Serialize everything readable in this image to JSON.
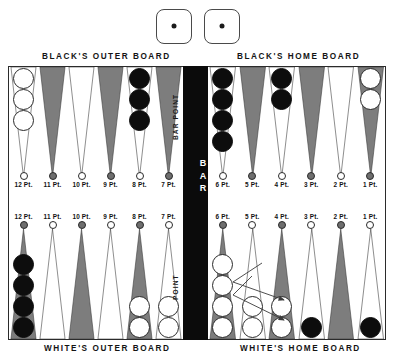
{
  "dice": {
    "name": "dice-pair",
    "values": [
      1,
      1
    ],
    "count": 2
  },
  "headings": {
    "black_outer": "BLACK'S OUTER BOARD",
    "black_home": "BLACK'S HOME BOARD",
    "white_outer": "WHITE'S OUTER BOARD",
    "white_home": "WHITE'S HOME BOARD"
  },
  "bar": {
    "label": "BAR",
    "color": "#0b0b0b"
  },
  "inline_labels": {
    "bar_point": "BAR POINT",
    "point": "POINT"
  },
  "colors": {
    "checker_black": "#0d0d0d",
    "checker_white": "#ffffff",
    "triangle_dark": "#7d7d7d",
    "triangle_light": "#ffffff",
    "board_border": "#2b2b2b",
    "bar_black": "#0b0b0b",
    "arrow": "#3b3b3b"
  },
  "point_labels": {
    "top_left": [
      "12 Pt.",
      "11 Pt.",
      "10 Pt.",
      "9 Pt.",
      "8 Pt.",
      "7 Pt."
    ],
    "top_right": [
      "6 Pt.",
      "5 Pt.",
      "4 Pt.",
      "3 Pt.",
      "2 Pt.",
      "1 Pt."
    ],
    "bottom_left": [
      "12 Pt.",
      "11 Pt.",
      "10 Pt.",
      "9 Pt.",
      "8 Pt.",
      "7 Pt."
    ],
    "bottom_right": [
      "6 Pt.",
      "5 Pt.",
      "4 Pt.",
      "3 Pt.",
      "2 Pt.",
      "1 Pt."
    ]
  },
  "board": {
    "top_left_quadrant": [
      {
        "point": "12 Pt.",
        "shade": "light",
        "checker_color": "white",
        "checkers": 3
      },
      {
        "point": "11 Pt.",
        "shade": "dark",
        "checker_color": "none",
        "checkers": 0
      },
      {
        "point": "10 Pt.",
        "shade": "light",
        "checker_color": "none",
        "checkers": 0
      },
      {
        "point": "9 Pt.",
        "shade": "dark",
        "checker_color": "none",
        "checkers": 0
      },
      {
        "point": "8 Pt.",
        "shade": "light",
        "checker_color": "black",
        "checkers": 3
      },
      {
        "point": "7 Pt.",
        "shade": "dark",
        "checker_color": "none",
        "checkers": 0
      }
    ],
    "top_right_quadrant": [
      {
        "point": "6 Pt.",
        "shade": "light",
        "checker_color": "black",
        "checkers": 4
      },
      {
        "point": "5 Pt.",
        "shade": "dark",
        "checker_color": "none",
        "checkers": 0
      },
      {
        "point": "4 Pt.",
        "shade": "light",
        "checker_color": "black",
        "checkers": 2
      },
      {
        "point": "3 Pt.",
        "shade": "dark",
        "checker_color": "none",
        "checkers": 0
      },
      {
        "point": "2 Pt.",
        "shade": "light",
        "checker_color": "none",
        "checkers": 0
      },
      {
        "point": "1 Pt.",
        "shade": "dark",
        "checker_color": "white",
        "checkers": 2
      }
    ],
    "bottom_left_quadrant": [
      {
        "point": "12 Pt.",
        "shade": "dark",
        "checker_color": "black",
        "checkers": 4
      },
      {
        "point": "11 Pt.",
        "shade": "light",
        "checker_color": "none",
        "checkers": 0
      },
      {
        "point": "10 Pt.",
        "shade": "dark",
        "checker_color": "none",
        "checkers": 0
      },
      {
        "point": "9 Pt.",
        "shade": "light",
        "checker_color": "none",
        "checkers": 0
      },
      {
        "point": "8 Pt.",
        "shade": "dark",
        "checker_color": "white",
        "checkers": 2
      },
      {
        "point": "7 Pt.",
        "shade": "light",
        "checker_color": "white",
        "checkers": 2
      }
    ],
    "bottom_right_quadrant": [
      {
        "point": "6 Pt.",
        "shade": "dark",
        "checker_color": "white",
        "checkers": 4
      },
      {
        "point": "5 Pt.",
        "shade": "light",
        "checker_color": "white",
        "checkers": 2
      },
      {
        "point": "4 Pt.",
        "shade": "dark",
        "checker_color": "white",
        "checkers": 2
      },
      {
        "point": "3 Pt.",
        "shade": "light",
        "checker_color": "black",
        "checkers": 1
      },
      {
        "point": "2 Pt.",
        "shade": "dark",
        "checker_color": "none",
        "checkers": 0
      },
      {
        "point": "1 Pt.",
        "shade": "light",
        "checker_color": "black",
        "checkers": 1
      }
    ]
  },
  "move_arrows": [
    {
      "from": "6 Pt.",
      "to": "4 Pt.",
      "description": "white checker moves from 6 point to 4 point"
    },
    {
      "from": "6 Pt.",
      "to": "4 Pt.",
      "description": "second white checker moves from 6 point to 4 point"
    }
  ]
}
